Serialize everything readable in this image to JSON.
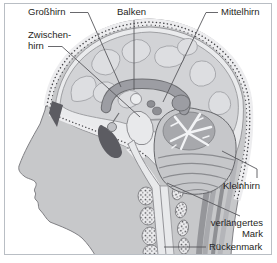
{
  "diagram": {
    "title_hint": "Sagittal head section with labeled brain regions",
    "labels": {
      "grosshirn": "Großhirn",
      "zwischenhirn_line1": "Zwischen-",
      "zwischenhirn_line2": "hirn",
      "balken": "Balken",
      "mittelhirn": "Mittelhirn",
      "kleinhirn": "Kleinhirn",
      "verlaengertes_mark_line1": "verlängertes",
      "verlaengertes_mark_line2": "Mark",
      "rueckenmark": "Rückenmark"
    },
    "colors": {
      "background": "#ffffff",
      "frame_border": "#b9bec4",
      "skin": "#c7c8ca",
      "outline": "#6e6f73",
      "cranial_cavity": "#eaebed",
      "cerebrum": "#d2d3d6",
      "gyri": "#dddee1",
      "corpus_callosum": "#9c9da3",
      "cerebellum": "#c6c7ca",
      "arbor_vitae": "#f2f3f5",
      "brainstem": "#e8e9eb",
      "bone_band": "#ededef",
      "bone_dots": "#46464a",
      "dark_sinus": "#5c5c62",
      "muscle": "#9b9ca0",
      "text": "#1f1f23",
      "leader_line": "#58585c"
    }
  }
}
